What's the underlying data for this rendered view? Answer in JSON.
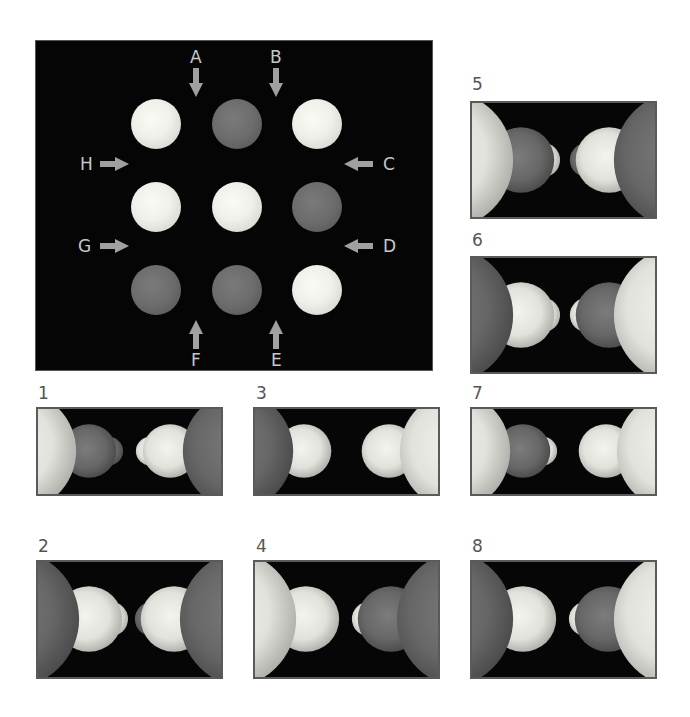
{
  "figure": {
    "main_view": {
      "background": "#050505",
      "grid": [
        [
          "light",
          "dark",
          "light"
        ],
        [
          "light",
          "light",
          "dark"
        ],
        [
          "dark",
          "dark",
          "light"
        ]
      ],
      "arrows": [
        {
          "label": "A",
          "direction": "down"
        },
        {
          "label": "B",
          "direction": "down"
        },
        {
          "label": "C",
          "direction": "left"
        },
        {
          "label": "D",
          "direction": "left"
        },
        {
          "label": "E",
          "direction": "up"
        },
        {
          "label": "F",
          "direction": "up"
        },
        {
          "label": "G",
          "direction": "right"
        },
        {
          "label": "H",
          "direction": "right"
        }
      ]
    },
    "options": [
      {
        "number": "1",
        "left": [
          "light",
          "dark",
          "dark"
        ],
        "right": [
          "dark",
          "light",
          "light"
        ]
      },
      {
        "number": "2",
        "left": [
          "dark",
          "light",
          "light"
        ],
        "right": [
          "dark",
          "light",
          "dark"
        ]
      },
      {
        "number": "3",
        "left": [
          "dark",
          "light"
        ],
        "right": [
          "light",
          "light"
        ]
      },
      {
        "number": "4",
        "left": [
          "light",
          "light"
        ],
        "right": [
          "dark",
          "dark",
          "light"
        ]
      },
      {
        "number": "5",
        "left": [
          "light",
          "dark",
          "light"
        ],
        "right": [
          "dark",
          "light",
          "dark"
        ]
      },
      {
        "number": "6",
        "left": [
          "dark",
          "light",
          "light"
        ],
        "right": [
          "light",
          "dark",
          "light"
        ]
      },
      {
        "number": "7",
        "left": [
          "light",
          "dark",
          "light"
        ],
        "right": [
          "light",
          "light"
        ]
      },
      {
        "number": "8",
        "left": [
          "dark",
          "light"
        ],
        "right": [
          "light",
          "dark",
          "light"
        ]
      }
    ],
    "colors": {
      "light_sphere": "#f0f0ea",
      "dark_sphere": "#6c6c6c",
      "arrow": "#a0a0a0",
      "label_text": "#c8c8c8",
      "option_number": "#555555"
    }
  }
}
